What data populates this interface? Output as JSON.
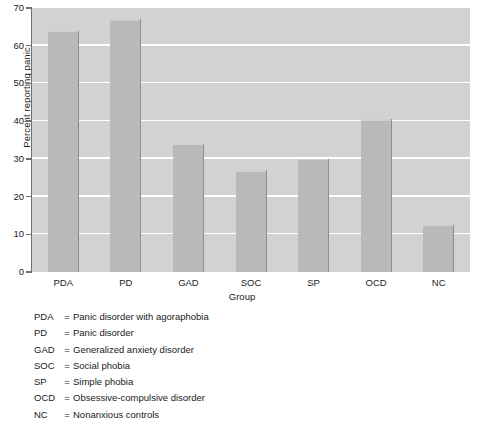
{
  "chart_data": {
    "type": "bar",
    "title": "",
    "xlabel": "Group",
    "ylabel": "Percent reporting panic",
    "categories": [
      "PDA",
      "PD",
      "GAD",
      "SOC",
      "SP",
      "OCD",
      "NC"
    ],
    "values": [
      64,
      67,
      34,
      27,
      30,
      40.5,
      12.5
    ],
    "ylim": [
      0,
      70
    ],
    "ytick_labels": [
      "0",
      "10",
      "20",
      "30",
      "40",
      "50",
      "60",
      "70"
    ],
    "yticks": [
      0,
      10,
      20,
      30,
      40,
      50,
      60,
      70
    ],
    "grid": "horizontal",
    "legend_position": "below-plot",
    "colors": {
      "bar_fill": "#b9b9b9",
      "bar_edge": "#8f8f8f",
      "plot_background": "#d2d2d2",
      "gridline": "#ffffff",
      "axis": "#6f6f6f",
      "page_background": "#ffffff",
      "text": "#1a1a1a"
    }
  },
  "legend": {
    "entries": [
      {
        "abbr": "PDA",
        "eq": "=",
        "description": "Panic disorder with agoraphobia"
      },
      {
        "abbr": "PD",
        "eq": "=",
        "description": "Panic disorder"
      },
      {
        "abbr": "GAD",
        "eq": "=",
        "description": "Generalized anxiety disorder"
      },
      {
        "abbr": "SOC",
        "eq": "=",
        "description": "Social phobia"
      },
      {
        "abbr": "SP",
        "eq": "=",
        "description": "Simple phobia"
      },
      {
        "abbr": "OCD",
        "eq": "=",
        "description": "Obsessive-compulsive disorder"
      },
      {
        "abbr": "NC",
        "eq": "=",
        "description": "Nonanxious controls"
      }
    ]
  }
}
